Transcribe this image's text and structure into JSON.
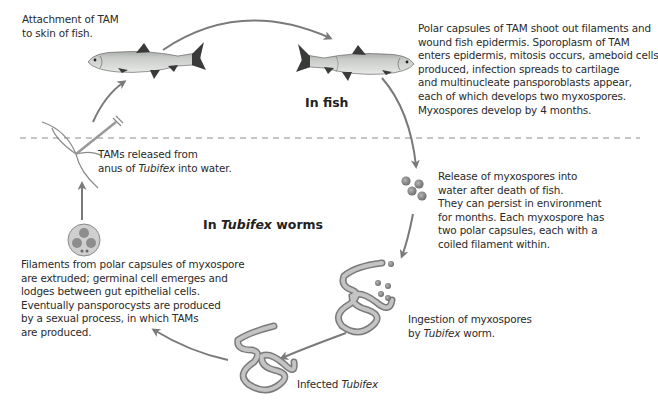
{
  "diagram": {
    "regions": {
      "fish": {
        "label": "In fish"
      },
      "worms": {
        "label_prefix": "In ",
        "label_italic": "Tubifex",
        "label_suffix": " worms"
      }
    },
    "colors": {
      "arrow": "#7a7a7a",
      "divider": "#8a8a8a",
      "text": "#2a2a2a",
      "fish_body": "#b9bcb9",
      "fish_dark": "#3a3a3a",
      "worm": "#a8a8a8",
      "spore": "#8c8c8c"
    },
    "steps": [
      {
        "id": "attachment",
        "lines": [
          "Attachment of TAM",
          "to skin of fish."
        ]
      },
      {
        "id": "infection-in-fish",
        "lines": [
          "Polar capsules of TAM shoot out filaments and",
          "wound fish epidermis. Sporoplasm of TAM",
          "enters epidermis, mitosis occurs, ameboid cells",
          "produced, infection spreads to cartilage",
          "and multinucleate pansporoblasts appear,",
          "each of which develops two myxospores.",
          "Myxospores develop by 4 months."
        ]
      },
      {
        "id": "release-myxospores",
        "lines": [
          "Release of myxospores into",
          "water after death of fish.",
          "They can persist in environment",
          "for months. Each myxospore has",
          "two polar capsules, each with a",
          "coiled filament within."
        ]
      },
      {
        "id": "ingestion",
        "line1": "Ingestion of myxospores",
        "line2_prefix": "by ",
        "line2_italic": "Tubifex",
        "line2_suffix": " worm."
      },
      {
        "id": "infected-tubifex",
        "prefix": "Infected ",
        "italic": "Tubifex"
      },
      {
        "id": "development-in-worm",
        "lines": [
          "Filaments from polar capsules of myxospore",
          "are extruded; germinal cell emerges and",
          "lodges between gut epithelial cells.",
          "Eventually pansporocysts are produced",
          "by a sexual process, in which TAMs",
          "are produced."
        ]
      },
      {
        "id": "tams-released",
        "line1": "TAMs released from",
        "line2_prefix": "anus of ",
        "line2_italic": "Tubifex",
        "line2_suffix": " into water."
      }
    ]
  }
}
